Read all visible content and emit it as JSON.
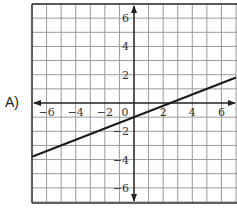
{
  "option": {
    "label": "A)"
  },
  "chart_data": {
    "type": "line",
    "title": "",
    "xlabel": "",
    "ylabel": "",
    "xlim": [
      -7,
      7
    ],
    "ylim": [
      -7,
      7
    ],
    "grid": true,
    "x_tick_labels": [
      "−6",
      "−4",
      "−2",
      "0",
      "2",
      "4",
      "6"
    ],
    "x_tick_values": [
      -6,
      -4,
      -2,
      0,
      2,
      4,
      6
    ],
    "y_tick_labels": [
      "6",
      "4",
      "2",
      "−2",
      "−4",
      "−6"
    ],
    "y_tick_values": [
      6,
      4,
      2,
      -2,
      -4,
      -6
    ],
    "series": [
      {
        "name": "line",
        "equation": "y = 0.4x - 1",
        "slope": 0.4,
        "y_intercept": -1,
        "x_intercept": 2.5,
        "x": [
          -7,
          7
        ],
        "y": [
          -3.8,
          1.8
        ]
      }
    ],
    "colors": {
      "grid": "#9a9a9a",
      "axis": "#222222",
      "line": "#1a1a1a"
    }
  }
}
